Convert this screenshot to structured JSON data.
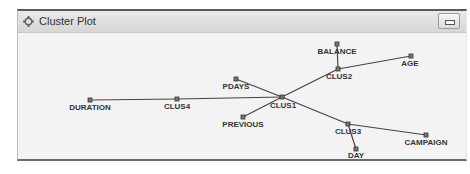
{
  "window": {
    "title": "Cluster Plot",
    "icon": "cluster-icon",
    "minimize_icon": "minimize-icon"
  },
  "plot": {
    "line_color": "#444444",
    "node_color": "#333333",
    "nodes": [
      {
        "id": "DURATION",
        "label": "DURATION",
        "x": 90,
        "y": 100,
        "lx": 90,
        "ly": 110
      },
      {
        "id": "CLUS4",
        "label": "CLUS4",
        "x": 177,
        "y": 99,
        "lx": 177,
        "ly": 109
      },
      {
        "id": "CLUS1",
        "label": "CLUS1",
        "x": 282,
        "y": 97,
        "lx": 283,
        "ly": 108
      },
      {
        "id": "PDAYS",
        "label": "PDAYS",
        "x": 236,
        "y": 79,
        "lx": 236,
        "ly": 89
      },
      {
        "id": "PREVIOUS",
        "label": "PREVIOUS",
        "x": 243,
        "y": 117,
        "lx": 243,
        "ly": 127
      },
      {
        "id": "CLUS2",
        "label": "CLUS2",
        "x": 338,
        "y": 69,
        "lx": 339,
        "ly": 79
      },
      {
        "id": "BALANCE",
        "label": "BALANCE",
        "x": 337,
        "y": 44,
        "lx": 337,
        "ly": 54
      },
      {
        "id": "AGE",
        "label": "AGE",
        "x": 411,
        "y": 56,
        "lx": 410,
        "ly": 66
      },
      {
        "id": "CLUS3",
        "label": "CLUS3",
        "x": 348,
        "y": 124,
        "lx": 348,
        "ly": 134
      },
      {
        "id": "DAY",
        "label": "DAY",
        "x": 356,
        "y": 149,
        "lx": 356,
        "ly": 158
      },
      {
        "id": "CAMPAIGN",
        "label": "CAMPAIGN",
        "x": 426,
        "y": 135,
        "lx": 426,
        "ly": 145
      }
    ],
    "edges": [
      [
        "DURATION",
        "CLUS4"
      ],
      [
        "CLUS4",
        "CLUS1"
      ],
      [
        "PDAYS",
        "CLUS1"
      ],
      [
        "PREVIOUS",
        "CLUS1"
      ],
      [
        "CLUS1",
        "CLUS2"
      ],
      [
        "CLUS2",
        "BALANCE"
      ],
      [
        "CLUS2",
        "AGE"
      ],
      [
        "CLUS1",
        "CLUS3"
      ],
      [
        "CLUS3",
        "DAY"
      ],
      [
        "CLUS3",
        "CAMPAIGN"
      ]
    ]
  }
}
